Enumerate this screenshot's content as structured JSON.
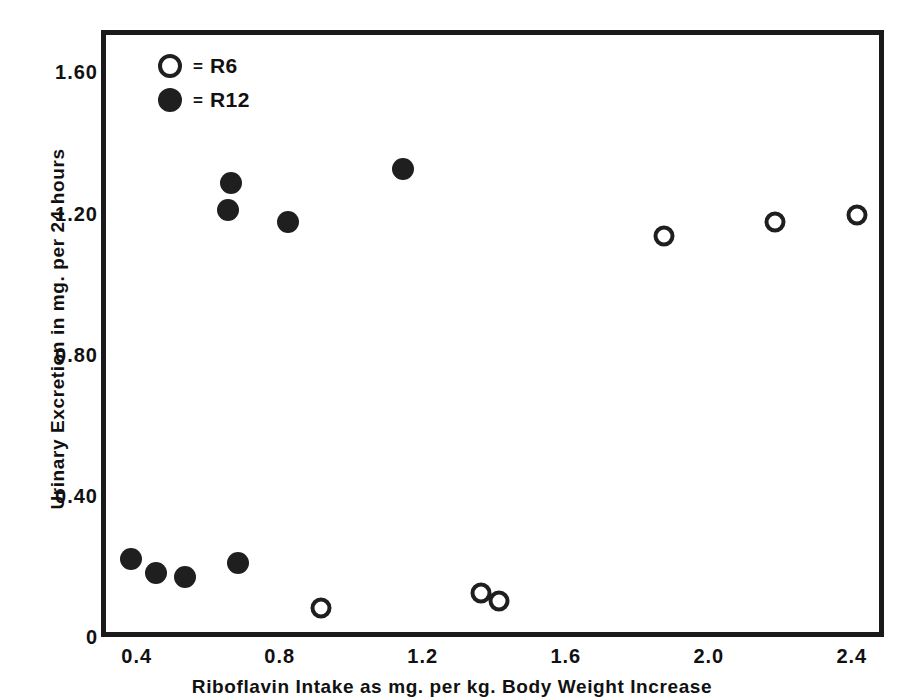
{
  "chart_data": {
    "type": "scatter",
    "title": "",
    "xlabel": "Riboflavin Intake as mg. per kg. Body Weight Increase",
    "ylabel": "Urinary Excretion in mg. per 24 hours",
    "xlim": [
      0.3,
      2.49
    ],
    "ylim": [
      0,
      1.72
    ],
    "xticks": [
      "0.4",
      "0.8",
      "1.2",
      "1.6",
      "2.0",
      "2.4"
    ],
    "xtick_values": [
      0.4,
      0.8,
      1.2,
      1.6,
      2.0,
      2.4
    ],
    "yticks": [
      "1.60",
      "1.20",
      "0.80",
      "0.40",
      "0"
    ],
    "ytick_values": [
      1.6,
      1.2,
      0.8,
      0.4,
      0
    ],
    "grid": false,
    "legend_position": "top-left",
    "marker_color": "#1f1f1f",
    "series": [
      {
        "name": "R6",
        "marker": "open-circle",
        "legend_symbol": "○",
        "legend_separator": "=",
        "points": [
          {
            "x": 0.9,
            "y": 0.095
          },
          {
            "x": 1.35,
            "y": 0.14
          },
          {
            "x": 1.4,
            "y": 0.115
          },
          {
            "x": 1.86,
            "y": 1.15
          },
          {
            "x": 2.17,
            "y": 1.19
          },
          {
            "x": 2.4,
            "y": 1.21
          }
        ]
      },
      {
        "name": "R12",
        "marker": "filled-circle",
        "legend_symbol": "●",
        "legend_separator": "=",
        "points": [
          {
            "x": 0.37,
            "y": 0.235
          },
          {
            "x": 0.44,
            "y": 0.195
          },
          {
            "x": 0.52,
            "y": 0.185
          },
          {
            "x": 0.67,
            "y": 0.225
          },
          {
            "x": 0.64,
            "y": 1.225
          },
          {
            "x": 0.65,
            "y": 1.3
          },
          {
            "x": 0.81,
            "y": 1.19
          },
          {
            "x": 1.13,
            "y": 1.34
          }
        ]
      }
    ]
  },
  "legend": {
    "rows": [
      {
        "symbol": "open",
        "separator": "=",
        "label": "R6"
      },
      {
        "symbol": "filled",
        "separator": "=",
        "label": "R12"
      }
    ]
  }
}
